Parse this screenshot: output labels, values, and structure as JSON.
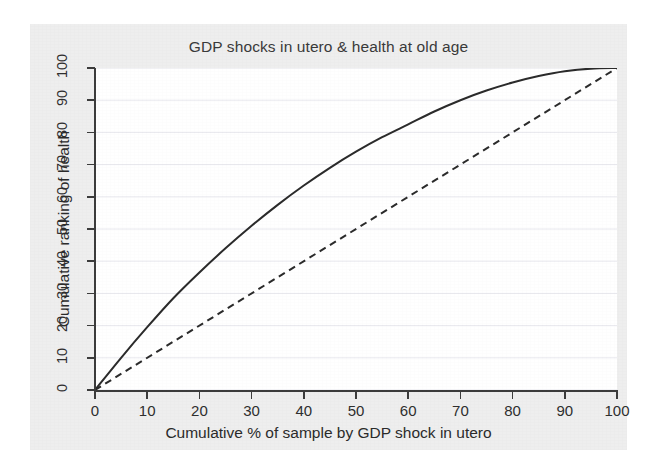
{
  "figure": {
    "background_color": "#eeeeee",
    "panel_color": "#ffffff",
    "axis_color": "#3c3c3c",
    "grid_color": "#e8e8ee"
  },
  "chart_data": {
    "type": "line",
    "title": "GDP shocks in utero & health at old age",
    "xlabel": "Cumulative % of sample by GDP shock in utero",
    "ylabel": "Cumulative ranking of health",
    "xlim": [
      0,
      100
    ],
    "ylim": [
      0,
      100
    ],
    "xticks": [
      0,
      10,
      20,
      30,
      40,
      50,
      60,
      70,
      80,
      90,
      100
    ],
    "yticks": [
      0,
      10,
      20,
      30,
      40,
      50,
      60,
      70,
      80,
      90,
      100
    ],
    "xtick_labels": [
      "0",
      "10",
      "20",
      "30",
      "40",
      "50",
      "60",
      "70",
      "80",
      "90",
      "100"
    ],
    "ytick_labels": [
      "0",
      "10",
      "20",
      "30",
      "40",
      "50",
      "60",
      "70",
      "80",
      "90",
      "100"
    ],
    "grid": "horizontal",
    "legend": "none",
    "series": [
      {
        "name": "concentration-curve",
        "style": "solid",
        "color": "#2b2b2b",
        "width": 2.0,
        "x": [
          0,
          5,
          10,
          15,
          20,
          25,
          30,
          35,
          40,
          45,
          50,
          55,
          60,
          65,
          70,
          75,
          80,
          85,
          90,
          95,
          100
        ],
        "y": [
          0,
          10,
          19.5,
          28.5,
          36.5,
          44,
          51,
          57.5,
          63.5,
          69,
          74,
          78.5,
          82.5,
          86.5,
          90,
          93,
          95.5,
          97.5,
          99,
          99.8,
          100
        ]
      },
      {
        "name": "equality-line",
        "style": "dashed",
        "color": "#2b2b2b",
        "width": 2.0,
        "x": [
          0,
          100
        ],
        "y": [
          0,
          100
        ]
      }
    ]
  }
}
